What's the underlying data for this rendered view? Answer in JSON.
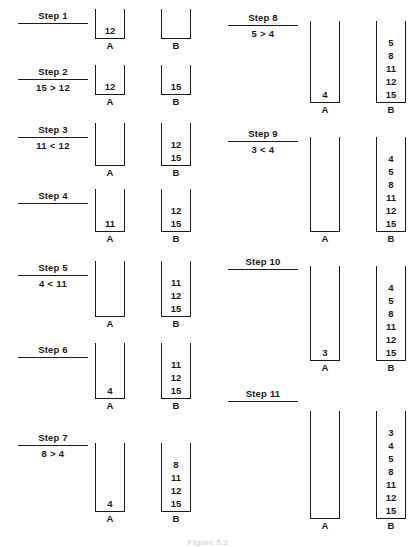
{
  "figure": {
    "caption": "Figure 5.2",
    "stack_label_a": "A",
    "stack_label_b": "B",
    "ink_color": "#1a1a1a",
    "background_color": "#ffffff"
  },
  "layout": {
    "width": 416,
    "height": 547,
    "columns": 2,
    "left_column_steps": [
      1,
      2,
      3,
      4,
      5,
      6,
      7
    ],
    "right_column_steps": [
      8,
      9,
      10,
      11
    ]
  },
  "steps": [
    {
      "id": "step-1",
      "label": "Step 1",
      "comparison": "",
      "column": "left",
      "top": 10,
      "label_left": 18,
      "label_width": 70,
      "stacks_left": 95,
      "baseline": 52,
      "stack_height": 30,
      "stack_a": [
        "12"
      ],
      "stack_b": []
    },
    {
      "id": "step-2",
      "label": "Step 2",
      "comparison": "15 > 12",
      "column": "left",
      "top": 66,
      "label_left": 18,
      "label_width": 70,
      "stacks_left": 95,
      "baseline": 108,
      "stack_height": 30,
      "stack_a": [
        "12"
      ],
      "stack_b": [
        "15"
      ]
    },
    {
      "id": "step-3",
      "label": "Step 3",
      "comparison": "11 < 12",
      "column": "left",
      "top": 124,
      "label_left": 18,
      "label_width": 70,
      "stacks_left": 95,
      "baseline": 179,
      "stack_height": 43,
      "stack_a": [],
      "stack_b": [
        "12",
        "15"
      ]
    },
    {
      "id": "step-4",
      "label": "Step 4",
      "comparison": "",
      "column": "left",
      "top": 190,
      "label_left": 18,
      "label_width": 70,
      "stacks_left": 95,
      "baseline": 245,
      "stack_height": 43,
      "stack_a": [
        "11"
      ],
      "stack_b": [
        "12",
        "15"
      ]
    },
    {
      "id": "step-5",
      "label": "Step 5",
      "comparison": "4 < 11",
      "column": "left",
      "top": 262,
      "label_left": 18,
      "label_width": 70,
      "stacks_left": 95,
      "baseline": 330,
      "stack_height": 56,
      "stack_a": [],
      "stack_b": [
        "11",
        "12",
        "15"
      ]
    },
    {
      "id": "step-6",
      "label": "Step 6",
      "comparison": "",
      "column": "left",
      "top": 344,
      "label_left": 18,
      "label_width": 70,
      "stacks_left": 95,
      "baseline": 412,
      "stack_height": 56,
      "stack_a": [
        "4"
      ],
      "stack_b": [
        "11",
        "12",
        "15"
      ]
    },
    {
      "id": "step-7",
      "label": "Step 7",
      "comparison": "8 > 4",
      "column": "left",
      "top": 432,
      "label_left": 18,
      "label_width": 70,
      "stacks_left": 95,
      "baseline": 525,
      "stack_height": 69,
      "stack_a": [
        "4"
      ],
      "stack_b": [
        "8",
        "11",
        "12",
        "15"
      ]
    },
    {
      "id": "step-8",
      "label": "Step 8",
      "comparison": "5 > 4",
      "column": "right",
      "top": 12,
      "label_left": 228,
      "label_width": 70,
      "stacks_left": 310,
      "baseline": 116,
      "stack_height": 82,
      "stack_a": [
        "4"
      ],
      "stack_b": [
        "5",
        "8",
        "11",
        "12",
        "15"
      ]
    },
    {
      "id": "step-9",
      "label": "Step 9",
      "comparison": "3 < 4",
      "column": "right",
      "top": 128,
      "label_left": 228,
      "label_width": 70,
      "stacks_left": 310,
      "baseline": 245,
      "stack_height": 95,
      "stack_a": [],
      "stack_b": [
        "4",
        "5",
        "8",
        "11",
        "12",
        "15"
      ]
    },
    {
      "id": "step-10",
      "label": "Step 10",
      "comparison": "",
      "column": "right",
      "top": 256,
      "label_left": 228,
      "label_width": 70,
      "stacks_left": 310,
      "baseline": 374,
      "stack_height": 95,
      "stack_a": [
        "3"
      ],
      "stack_b": [
        "4",
        "5",
        "8",
        "11",
        "12",
        "15"
      ]
    },
    {
      "id": "step-11",
      "label": "Step 11",
      "comparison": "",
      "column": "right",
      "top": 388,
      "label_left": 228,
      "label_width": 70,
      "stacks_left": 310,
      "baseline": 532,
      "stack_height": 108,
      "stack_a": [],
      "stack_b": [
        "3",
        "4",
        "5",
        "8",
        "11",
        "12",
        "15"
      ]
    }
  ]
}
